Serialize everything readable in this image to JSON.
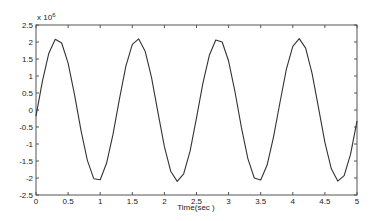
{
  "chart_data": {
    "type": "line",
    "title": "",
    "xlabel": "Time(sec )",
    "ylabel": "",
    "y_multiplier_label": "x 10",
    "y_multiplier_exponent": "6",
    "xlim": [
      0,
      5
    ],
    "ylim": [
      -2.5,
      2.5
    ],
    "grid": false,
    "legend": null,
    "x_ticks": [
      0,
      0.5,
      1,
      1.5,
      2,
      2.5,
      3,
      3.5,
      4,
      4.5,
      5
    ],
    "x_tick_labels": [
      "0",
      "0.5",
      "1",
      "1.5",
      "2",
      "2.5",
      "3",
      "3.5",
      "4",
      "4.5",
      "5"
    ],
    "y_ticks": [
      2.5,
      2,
      1.5,
      1,
      0.5,
      0,
      -0.5,
      -1,
      -1.5,
      -2,
      -2.5
    ],
    "y_tick_labels": [
      "2.5",
      "2",
      "1.5",
      "1",
      "0.5",
      "0",
      "-0.5",
      "-1",
      "-1.5",
      "-2",
      "-2.5"
    ],
    "series": [
      {
        "name": "signal",
        "color": "#333333",
        "x": [
          0,
          0.1,
          0.2,
          0.3,
          0.4,
          0.5,
          0.6,
          0.7,
          0.8,
          0.9,
          1.0,
          1.1,
          1.2,
          1.3,
          1.4,
          1.5,
          1.6,
          1.7,
          1.8,
          1.9,
          2.0,
          2.1,
          2.2,
          2.3,
          2.4,
          2.5,
          2.6,
          2.7,
          2.8,
          2.9,
          3.0,
          3.1,
          3.2,
          3.3,
          3.4,
          3.5,
          3.6,
          3.7,
          3.8,
          3.9,
          4.0,
          4.1,
          4.2,
          4.3,
          4.4,
          4.5,
          4.6,
          4.7,
          4.8,
          4.9,
          5.0
        ],
        "values": [
          -0.18,
          0.85,
          1.67,
          2.08,
          1.97,
          1.38,
          0.45,
          -0.59,
          -1.48,
          -2.02,
          -2.05,
          -1.56,
          -0.71,
          0.33,
          1.29,
          1.93,
          2.09,
          1.73,
          0.95,
          -0.08,
          -1.08,
          -1.81,
          -2.1,
          -1.88,
          -1.21,
          -0.23,
          0.79,
          1.61,
          2.06,
          2.0,
          1.44,
          0.53,
          -0.52,
          -1.43,
          -2.0,
          -2.06,
          -1.62,
          -0.79,
          0.22,
          1.2,
          1.87,
          2.1,
          1.82,
          1.08,
          0.07,
          -0.95,
          -1.73,
          -2.09,
          -1.93,
          -1.3,
          -0.33
        ]
      }
    ]
  }
}
